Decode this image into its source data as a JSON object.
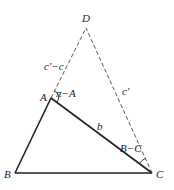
{
  "diagram": {
    "points": {
      "A": {
        "label": "A",
        "x": 51,
        "y": 98
      },
      "B": {
        "label": "B",
        "x": 15,
        "y": 173
      },
      "C": {
        "label": "C",
        "x": 152,
        "y": 173
      },
      "D": {
        "label": "D",
        "x": 86,
        "y": 28
      }
    },
    "segment_labels": {
      "AD": "c′−c",
      "CD": "c′",
      "AC": "b"
    },
    "angle_labels": {
      "A_exterior": "π−A",
      "C_angle": "B−C"
    },
    "colors": {
      "solid": "#222222",
      "dashed": "#444444"
    }
  }
}
